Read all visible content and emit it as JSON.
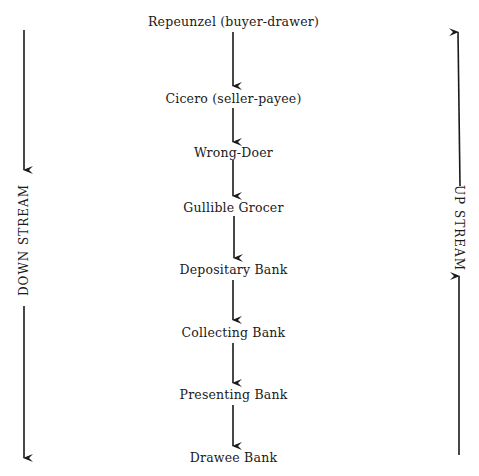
{
  "diagram": {
    "nodes": [
      {
        "label": "Repeunzel (buyer-drawer)",
        "y": 14
      },
      {
        "label": "Cicero (seller-payee)",
        "y": 91
      },
      {
        "label": "Wrong-Doer",
        "y": 145
      },
      {
        "label": "Gullible Grocer",
        "y": 200
      },
      {
        "label": "Depositary Bank",
        "y": 262
      },
      {
        "label": "Collecting Bank",
        "y": 325
      },
      {
        "label": "Presenting Bank",
        "y": 387
      },
      {
        "label": "Drawee Bank",
        "y": 450
      }
    ],
    "edges": [
      {
        "from": "Repeunzel (buyer-drawer)",
        "to": "Cicero (seller-payee)"
      },
      {
        "from": "Cicero (seller-payee)",
        "to": "Wrong-Doer"
      },
      {
        "from": "Wrong-Doer",
        "to": "Gullible Grocer"
      },
      {
        "from": "Gullible Grocer",
        "to": "Depositary Bank"
      },
      {
        "from": "Depositary Bank",
        "to": "Collecting Bank"
      },
      {
        "from": "Collecting Bank",
        "to": "Presenting Bank"
      },
      {
        "from": "Presenting Bank",
        "to": "Drawee Bank"
      }
    ],
    "side_labels": {
      "left": "DOWN STREAM",
      "right": "UP STREAM"
    },
    "colors": {
      "ink": "#1a1a1a",
      "background": "#ffffff"
    }
  }
}
